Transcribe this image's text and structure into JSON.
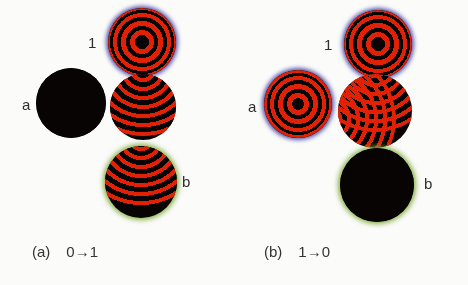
{
  "figure": {
    "background_color": "#fbfbfa",
    "ring_color": "#e02105",
    "node_color": "#080404",
    "halo_blue": "#2a2a96",
    "halo_green": "#78a52d",
    "label_color": "#2e2e2e"
  },
  "panels": [
    {
      "id": "a",
      "caption_tag": "(a)",
      "caption_text": "0→1",
      "transition_from": "0",
      "transition_to": "1",
      "nodes": [
        {
          "id": "node-a-left",
          "label": "a",
          "label_position": "left",
          "state": "inactive",
          "pattern": "solid",
          "rim": "none",
          "ring_count": 0
        },
        {
          "id": "node-a-top",
          "label": "1",
          "label_position": "left",
          "state": "active",
          "pattern": "bullseye",
          "rim": "blue",
          "ring_count": 4
        },
        {
          "id": "node-a-center",
          "label": "",
          "label_position": "none",
          "state": "propagating",
          "pattern": "arcs-from-top",
          "rim": "none",
          "ring_count": 9
        },
        {
          "id": "node-a-bottom",
          "label": "b",
          "label_position": "right",
          "state": "receiving",
          "pattern": "arcs-from-top",
          "rim": "green",
          "ring_count": 9
        }
      ]
    },
    {
      "id": "b",
      "caption_tag": "(b)",
      "caption_text": "1→0",
      "transition_from": "1",
      "transition_to": "0",
      "nodes": [
        {
          "id": "node-b-left",
          "label": "a",
          "label_position": "left",
          "state": "active",
          "pattern": "bullseye",
          "rim": "blue",
          "ring_count": 4
        },
        {
          "id": "node-b-top",
          "label": "1",
          "label_position": "left",
          "state": "active",
          "pattern": "bullseye",
          "rim": "blue",
          "ring_count": 4
        },
        {
          "id": "node-b-center",
          "label": "",
          "label_position": "none",
          "state": "interfering",
          "pattern": "arcs-from-top-and-left",
          "rim": "none",
          "ring_count": 9
        },
        {
          "id": "node-b-bottom",
          "label": "b",
          "label_position": "right",
          "state": "inactive",
          "pattern": "solid",
          "rim": "green",
          "ring_count": 0
        }
      ]
    }
  ]
}
